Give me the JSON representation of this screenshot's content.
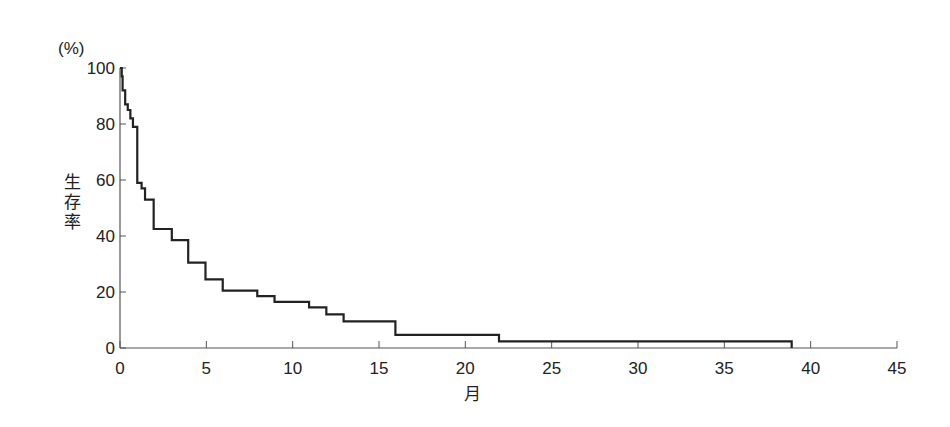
{
  "chart_data": {
    "type": "line",
    "subtype": "kaplan-meier-step",
    "title": "",
    "xlabel": "月",
    "ylabel": "生存率",
    "yunit": "(%)",
    "xlim": [
      0,
      45
    ],
    "ylim": [
      0,
      100
    ],
    "xticks": [
      0,
      5,
      10,
      15,
      20,
      25,
      30,
      35,
      40,
      45
    ],
    "yticks": [
      0,
      20,
      40,
      60,
      80,
      100
    ],
    "grid": false,
    "legend": null,
    "series": [
      {
        "name": "生存率",
        "step": "post",
        "x": [
          0,
          0.1,
          0.15,
          0.3,
          0.45,
          0.6,
          0.75,
          1.0,
          1.25,
          1.45,
          1.95,
          3.0,
          3.95,
          4.95,
          5.95,
          7.95,
          8.95,
          10.95,
          11.95,
          12.95,
          15.95,
          21.95,
          38.9
        ],
        "values": [
          100,
          97,
          92,
          87,
          85,
          82,
          79,
          59,
          57,
          53,
          42.5,
          38.5,
          30.5,
          24.5,
          20.5,
          18.5,
          16.5,
          14.5,
          12,
          9.5,
          4.7,
          2.4,
          0
        ]
      }
    ]
  },
  "axes": {
    "y_unit_label": "(%)",
    "y_title_chars": [
      "生",
      "存",
      "率"
    ],
    "x_title": "月"
  }
}
